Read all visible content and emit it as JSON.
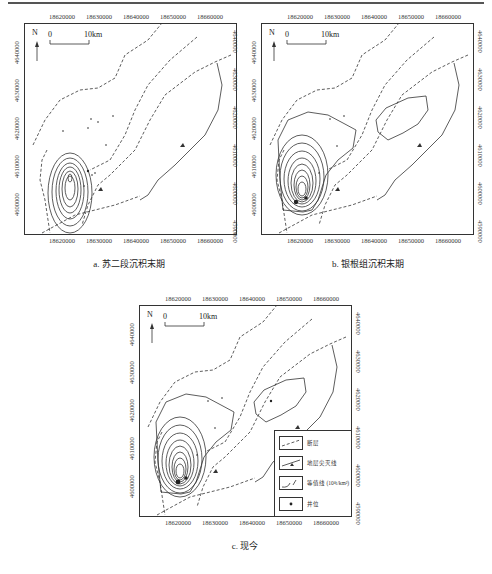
{
  "figure": {
    "panels": [
      {
        "id": "a",
        "caption": "a. 苏二段沉积末期",
        "x_ticks": [
          "18620000",
          "18630000",
          "18640000",
          "18650000",
          "18660000"
        ],
        "y_ticks": [
          "4640000",
          "4630000",
          "4620000",
          "4610000",
          "4600000",
          "4590000"
        ],
        "north_label": "N",
        "scale_start": "0",
        "scale_end": "10km"
      },
      {
        "id": "b",
        "caption": "b. 银根组沉积末期",
        "x_ticks": [
          "18620000",
          "18630000",
          "18640000",
          "18650000",
          "18660000"
        ],
        "y_ticks": [
          "4640000",
          "4630000",
          "4620000",
          "4610000",
          "4600000",
          "4590000"
        ],
        "north_label": "N",
        "scale_start": "0",
        "scale_end": "10km"
      },
      {
        "id": "c",
        "caption": "c. 现今",
        "x_ticks": [
          "18620000",
          "18630000",
          "18640000",
          "18650000",
          "18660000"
        ],
        "y_ticks": [
          "4640000",
          "4630000",
          "4620000",
          "4610000",
          "4600000",
          "4590000"
        ],
        "north_label": "N",
        "scale_start": "0",
        "scale_end": "10km"
      }
    ],
    "legend": {
      "items": [
        {
          "symbol": "dashed-line",
          "label": "断层"
        },
        {
          "symbol": "line-with-triangle",
          "label": "地层尖灭线"
        },
        {
          "symbol": "contour-line",
          "label": "等值线 (10⁴t/km²)"
        },
        {
          "symbol": "dot",
          "label": "井位"
        }
      ]
    }
  }
}
